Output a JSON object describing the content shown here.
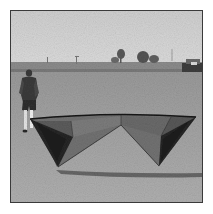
{
  "image": {
    "description": "Grayscale photograph of a large quad-line stunt kite resting on a grassy field with a person standing behind it",
    "subjects": [
      "stunt-kite",
      "person",
      "grass-field",
      "treeline",
      "buildings",
      "sky"
    ],
    "palette": {
      "page_bg": "#ffffff",
      "frame": "#3a3a3a",
      "sky": "#d4d4d4",
      "horizon": "#8a8a8a",
      "grass": "#a8a8a8",
      "kite_sail_light": "#6e6e6e",
      "kite_sail_dark": "#2a2a2a",
      "kite_edge": "#1a1a1a",
      "person_dark": "#3a3a3a",
      "person_legs": "#e8e8e8"
    }
  }
}
